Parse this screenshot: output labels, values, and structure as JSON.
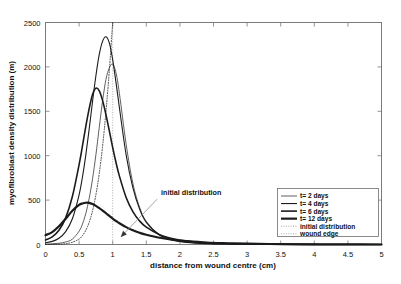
{
  "figure": {
    "background": "#ffffff",
    "frame_color": "#7a7a7a",
    "curve_color": "#1b1b1b"
  },
  "axes": {
    "x_title": "distance from wound centre  (cm)",
    "y_title": "myofibroblast density distribution (m)",
    "x_ticks": [
      "0",
      "0.5",
      "1",
      "1.5",
      "2",
      "2.5",
      "3",
      "3.5",
      "4",
      "4.5",
      "5"
    ],
    "y_ticks": [
      "0",
      "500",
      "1000",
      "1500",
      "2000",
      "2500"
    ]
  },
  "annotation": {
    "label": "initial distribution"
  },
  "legend": {
    "items": [
      {
        "label": "t= 2 days",
        "style": "solid",
        "width": 0.7
      },
      {
        "label": "t= 4 days",
        "style": "solid",
        "width": 1.1
      },
      {
        "label": "t= 6 days",
        "style": "solid",
        "width": 1.6
      },
      {
        "label": "t= 12 days",
        "style": "solid",
        "width": 2.2
      },
      {
        "label": "initial distribution",
        "style": "dotted",
        "width": 0.8
      },
      {
        "label": "wound edge",
        "style": "dotted",
        "width": 0.8
      }
    ]
  },
  "chart_data": {
    "type": "line",
    "title": "",
    "xlabel": "distance from wound centre  (cm)",
    "ylabel": "myofibroblast density distribution (m)",
    "xlim": [
      0,
      5
    ],
    "ylim": [
      0,
      2500
    ],
    "grid": false,
    "legend_position": "lower-right",
    "x": [
      0,
      0.1,
      0.2,
      0.3,
      0.4,
      0.5,
      0.55,
      0.6,
      0.65,
      0.7,
      0.75,
      0.8,
      0.85,
      0.9,
      0.95,
      1.0,
      1.05,
      1.1,
      1.2,
      1.3,
      1.4,
      1.5,
      1.7,
      1.9,
      2.1,
      2.4,
      2.7,
      3.0,
      3.5,
      4.0,
      4.5,
      5.0
    ],
    "series": [
      {
        "name": "t= 2 days",
        "linewidth": 0.7,
        "peak_x": 0.97,
        "peak_y": 2030,
        "values": [
          5,
          8,
          14,
          28,
          60,
          150,
          230,
          350,
          520,
          740,
          1010,
          1320,
          1620,
          1860,
          1990,
          2030,
          1930,
          1700,
          1130,
          690,
          420,
          260,
          110,
          52,
          27,
          12,
          6,
          3,
          1,
          0,
          0,
          0
        ]
      },
      {
        "name": "t= 4 days",
        "linewidth": 1.1,
        "peak_x": 0.8,
        "peak_y": 2340,
        "values": [
          20,
          35,
          70,
          145,
          290,
          560,
          760,
          1010,
          1300,
          1610,
          1900,
          2140,
          2290,
          2340,
          2270,
          2080,
          1820,
          1540,
          1010,
          640,
          400,
          250,
          105,
          48,
          24,
          10,
          5,
          2,
          1,
          0,
          0,
          0
        ]
      },
      {
        "name": "t= 6 days",
        "linewidth": 1.6,
        "peak_x": 0.72,
        "peak_y": 1760,
        "values": [
          50,
          85,
          160,
          300,
          540,
          900,
          1110,
          1330,
          1530,
          1690,
          1760,
          1730,
          1620,
          1460,
          1280,
          1090,
          920,
          770,
          530,
          370,
          265,
          195,
          110,
          65,
          40,
          20,
          11,
          6,
          2,
          1,
          0,
          0
        ]
      },
      {
        "name": "t= 12 days",
        "linewidth": 2.2,
        "peak_x": 0.63,
        "peak_y": 470,
        "values": [
          105,
          140,
          205,
          290,
          380,
          445,
          462,
          470,
          468,
          455,
          435,
          410,
          382,
          352,
          322,
          292,
          265,
          240,
          196,
          160,
          132,
          110,
          76,
          53,
          38,
          22,
          14,
          9,
          4,
          2,
          1,
          0
        ]
      },
      {
        "name": "initial distribution",
        "linestyle": "dotted",
        "linewidth": 0.8,
        "peak_x": 1.0,
        "peak_y": 2500,
        "values": [
          0,
          1,
          3,
          9,
          25,
          62,
          100,
          160,
          250,
          380,
          560,
          800,
          1110,
          1500,
          1960,
          2500,
          2500,
          2500,
          2500,
          2500,
          2500,
          2500,
          2500,
          2500,
          2500,
          2500,
          2500,
          2500,
          2500,
          2500,
          2500,
          2500
        ]
      }
    ],
    "vertical_markers": [
      {
        "name": "wound edge",
        "x": 1.0,
        "linestyle": "dotted"
      }
    ],
    "annotations": [
      {
        "text": "initial distribution",
        "text_x": 1.72,
        "text_y": 555,
        "arrow_to_x": 1.12,
        "arrow_to_y": 85
      }
    ]
  }
}
